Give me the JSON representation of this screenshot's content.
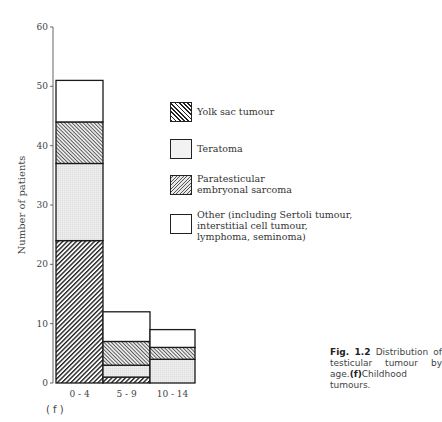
{
  "chart_data": {
    "type": "bar",
    "stacked": true,
    "title": "",
    "xlabel": "",
    "ylabel": "Number of patients",
    "ylim": [
      0,
      60
    ],
    "yticks": [
      0,
      10,
      20,
      30,
      40,
      50,
      60
    ],
    "categories": [
      "0 - 4",
      "5 - 9",
      "10 - 14"
    ],
    "series": [
      {
        "name": "Yolk sac tumour",
        "values": [
          24,
          1,
          0
        ],
        "pattern": "dense-diagonal-hatch"
      },
      {
        "name": "Teratoma",
        "values": [
          13,
          2,
          4
        ],
        "pattern": "stipple"
      },
      {
        "name": "Paratesticular embryonal sarcoma",
        "values": [
          7,
          4,
          2
        ],
        "pattern": "fine-diagonal-hatch"
      },
      {
        "name": "Other (including Sertoli tumour, interstitial cell tumour, lymphoma, seminoma)",
        "values": [
          7,
          5,
          3
        ],
        "pattern": "blank"
      }
    ],
    "totals": [
      51,
      12,
      9
    ],
    "grid": false,
    "legend_position": "right"
  },
  "legend": {
    "items": [
      {
        "key": "yolk",
        "label": "Yolk sac tumour"
      },
      {
        "key": "tera",
        "label": "Teratoma"
      },
      {
        "key": "para",
        "label": "Paratesticular\nembryonal sarcoma"
      },
      {
        "key": "other",
        "label": "Other (including Sertoli tumour,\ninterstitial cell tumour,\nlymphoma, seminoma)"
      }
    ]
  },
  "caption": {
    "fig_number": "Fig. 1.2",
    "text_1": " Distribution of testicular tumour by age.",
    "panel_ref": "(f)",
    "text_2": "Childhood tumours."
  },
  "panel_label": "( f )"
}
